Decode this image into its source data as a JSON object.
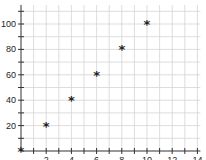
{
  "chart_data": {
    "type": "scatter",
    "title": "",
    "xlabel": "",
    "ylabel": "",
    "x": [
      0,
      2,
      4,
      6,
      8,
      10
    ],
    "y": [
      0,
      20,
      40,
      60,
      80,
      100
    ],
    "series": [
      {
        "name": "points",
        "marker": "asterisk",
        "x": [
          0,
          2,
          4,
          6,
          8,
          10
        ],
        "y": [
          0,
          20,
          40,
          60,
          80,
          100
        ]
      }
    ],
    "xlim": [
      0,
      14
    ],
    "ylim": [
      0,
      115
    ],
    "x_ticks": [
      2,
      4,
      6,
      8,
      10,
      12,
      14
    ],
    "y_ticks": [
      20,
      40,
      60,
      80,
      100
    ],
    "grid": true,
    "x_grid_step": 1,
    "y_grid_step": 10,
    "legend": "none",
    "colors": {
      "marker": "#222222",
      "grid": "#d4d4d4",
      "axis": "#333333"
    }
  }
}
